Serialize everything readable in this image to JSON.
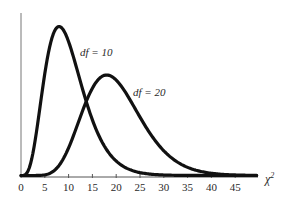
{
  "chart_data": {
    "type": "line",
    "title": "",
    "xlabel": "χ²",
    "ylabel": "",
    "xlim": [
      0,
      50
    ],
    "x_ticks": [
      0,
      5,
      10,
      15,
      20,
      25,
      30,
      35,
      40,
      45
    ],
    "x_tick_labels": [
      "0",
      "5",
      "10",
      "15",
      "20",
      "25",
      "30",
      "35",
      "40",
      "45"
    ],
    "grid": false,
    "legend": "inline labels",
    "series": [
      {
        "name": "df = 10",
        "label": "df = 10",
        "df": 10,
        "peak_x": 8
      },
      {
        "name": "df = 20",
        "label": "df = 20",
        "df": 20,
        "peak_x": 18
      }
    ],
    "colors": {
      "line": "#111111",
      "axis": "#555555",
      "text": "#2a2a2a"
    }
  },
  "labels": {
    "series1": "df = 10",
    "series2": "df = 20",
    "xaxis": "χ",
    "xaxis_sup": "2"
  }
}
